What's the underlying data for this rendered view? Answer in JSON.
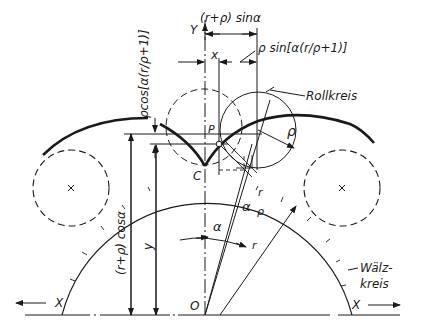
{
  "diagram": {
    "colors": {
      "ink": "#1a1a1a",
      "background": "#ffffff"
    },
    "axes": {
      "y_label": "Y",
      "x_left_label": "X",
      "x_right_label": "X",
      "origin_label": "O"
    },
    "points": {
      "c_label": "C",
      "p_label": "P"
    },
    "dimensions": {
      "top_dim": "(r+ρ) sinα",
      "x_dim": "x",
      "rho_sin": "ρ sin[α(r/ρ+1)]",
      "rho_cos": "ρcos[α(r/ρ+1)]",
      "r_rho_cos": "(r+ρ) cosα",
      "y_dim": "y",
      "rho": "ρ",
      "alpha": "α",
      "alpha_r_rho_a": "α",
      "alpha_r_rho_num": "r",
      "alpha_r_rho_den": "ρ",
      "r": "r"
    },
    "callouts": {
      "rollkreis": "Rollkreis",
      "waelzkreis_1": "Wälz-",
      "waelzkreis_2": "kreis"
    }
  }
}
